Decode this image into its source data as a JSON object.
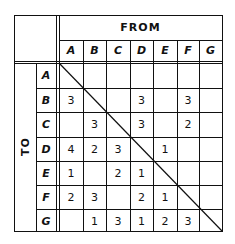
{
  "header": {
    "from_label": "FROM",
    "to_label": "TO"
  },
  "columns": [
    "A",
    "B",
    "C",
    "D",
    "E",
    "F",
    "G"
  ],
  "rows": [
    {
      "label": "A",
      "cells": [
        "",
        "",
        "",
        "",
        "",
        "",
        ""
      ]
    },
    {
      "label": "B",
      "cells": [
        "3",
        "",
        "",
        "3",
        "",
        "3",
        ""
      ]
    },
    {
      "label": "C",
      "cells": [
        "",
        "3",
        "",
        "3",
        "",
        "2",
        ""
      ]
    },
    {
      "label": "D",
      "cells": [
        "4",
        "2",
        "3",
        "",
        "1",
        "",
        ""
      ]
    },
    {
      "label": "E",
      "cells": [
        "1",
        "",
        "2",
        "1",
        "",
        "",
        ""
      ]
    },
    {
      "label": "F",
      "cells": [
        "2",
        "3",
        "",
        "2",
        "1",
        "",
        ""
      ]
    },
    {
      "label": "G",
      "cells": [
        "",
        "1",
        "3",
        "1",
        "2",
        "3",
        ""
      ]
    }
  ]
}
